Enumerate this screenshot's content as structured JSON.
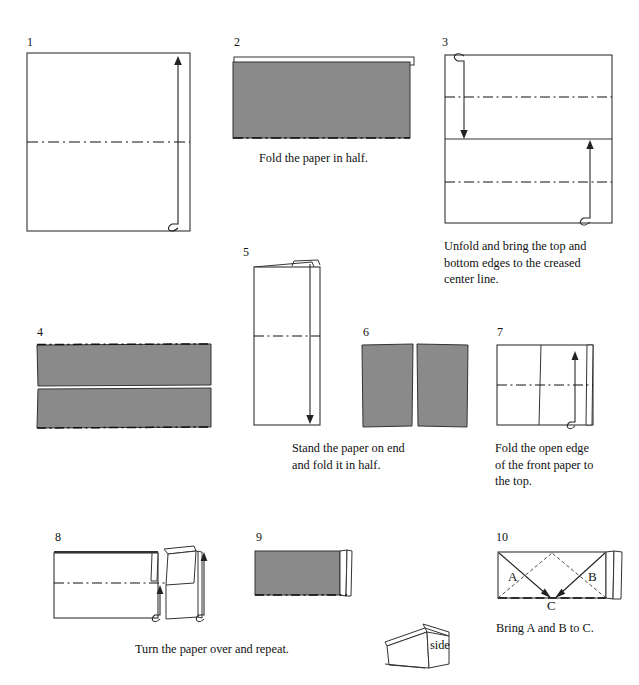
{
  "document": {
    "type": "origami-instruction-diagram",
    "title": "Paper folding instructions",
    "page_background": "#ffffff",
    "ink_color": "#1a1a1a",
    "paper_gray": "#8a8a8a",
    "paper_white": "#ffffff"
  },
  "steps": [
    {
      "number": "1",
      "caption": "",
      "shape": "square",
      "fill": "white",
      "annotations": [
        "dashed-center-line",
        "up-arrow-right"
      ]
    },
    {
      "number": "2",
      "caption": "Fold the paper in half.",
      "shape": "rectangle",
      "fill": "gray",
      "annotations": [
        "white-sliver-top",
        "dashed-bottom-edge"
      ]
    },
    {
      "number": "3",
      "caption": "Unfold and bring the top and\nbottom edges to the creased\ncenter line.",
      "shape": "square",
      "fill": "white",
      "annotations": [
        "solid-center-line",
        "dashed-quarter-lines",
        "down-arrow-left",
        "up-arrow-right"
      ]
    },
    {
      "number": "4",
      "caption": "",
      "shape": "rectangle",
      "fill": "gray",
      "annotations": [
        "center-split-gap",
        "dashed-top-edge",
        "dashed-bottom-edge"
      ]
    },
    {
      "number": "5",
      "caption": "Stand the paper on end\nand fold it in half.",
      "shape": "tall-rectangle",
      "fill": "white",
      "annotations": [
        "dashed-center-line",
        "top-flaps",
        "down-arrow-right"
      ]
    },
    {
      "number": "6",
      "caption": "",
      "shape": "square",
      "fill": "gray",
      "annotations": [
        "vertical-center-split"
      ]
    },
    {
      "number": "7",
      "caption": "Fold the open edge\nof the front paper to\nthe top.",
      "shape": "square",
      "fill": "white",
      "annotations": [
        "vertical-line",
        "dashed-center-line",
        "up-arrow-right"
      ]
    },
    {
      "number": "8",
      "caption": "Turn the paper over and repeat.",
      "shape": "rectangle",
      "fill": "white",
      "annotations": [
        "dashed-line",
        "right-flaps",
        "two-up-arrows"
      ]
    },
    {
      "number": "9",
      "caption": "",
      "shape": "rectangle",
      "fill": "gray",
      "annotations": [
        "dashed-bottom-edge",
        "right-flap-strips"
      ]
    },
    {
      "number": "10",
      "caption": "Bring A and B to C.",
      "shape": "rectangle",
      "fill": "white",
      "annotations": [
        "diagonal-solid-arrows",
        "diagonal-dashed-lines",
        "right-flap-strips"
      ],
      "labels": {
        "a": "A",
        "b": "B",
        "c": "C"
      }
    }
  ],
  "side_view": {
    "label": "side"
  }
}
